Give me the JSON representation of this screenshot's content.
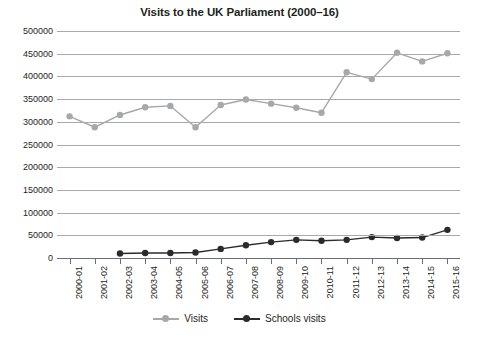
{
  "chart_data": {
    "type": "line",
    "title": "Visits to the UK Parliament (2000–16)",
    "xlabel": "",
    "ylabel": "",
    "ylim": [
      0,
      500000
    ],
    "ytick_step": 50000,
    "yticks": [
      500000,
      450000,
      400000,
      350000,
      300000,
      250000,
      200000,
      150000,
      100000,
      50000,
      0
    ],
    "ytick_labels": [
      "500000",
      "450000",
      "400000",
      "350000",
      "300000",
      "250000",
      "200000",
      "150000",
      "100000",
      "50000",
      "0"
    ],
    "grid": true,
    "grid_axis": "y",
    "legend_position": "bottom",
    "categories": [
      "2000-01",
      "2001-02",
      "2002-03",
      "2003-04",
      "2004-05",
      "2005-06",
      "2006-07",
      "2007-08",
      "2008-09",
      "2009-10",
      "2010-11",
      "2011-12",
      "2012-13",
      "2013-14",
      "2014-15",
      "2015-16"
    ],
    "series": [
      {
        "name": "Visits",
        "color": "#a6a8ab",
        "values": [
          312000,
          288000,
          315000,
          332000,
          335000,
          288000,
          337000,
          349000,
          340000,
          331000,
          320000,
          409000,
          394000,
          452000,
          433000,
          451000
        ]
      },
      {
        "name": "Schools visits",
        "color": "#2b2b2b",
        "values": [
          null,
          null,
          10000,
          11000,
          11000,
          12000,
          20000,
          28000,
          35000,
          40000,
          38000,
          40000,
          46000,
          44000,
          45000,
          62000
        ]
      }
    ]
  },
  "legend": {
    "entries": [
      {
        "label": "Visits"
      },
      {
        "label": "Schools visits"
      }
    ]
  },
  "colors": {
    "visits": "#a6a8ab",
    "schools": "#2b2b2b",
    "gridline": "#a7a9ac",
    "axis": "#6d6e71",
    "text": "#231f20",
    "background": "#ffffff"
  }
}
